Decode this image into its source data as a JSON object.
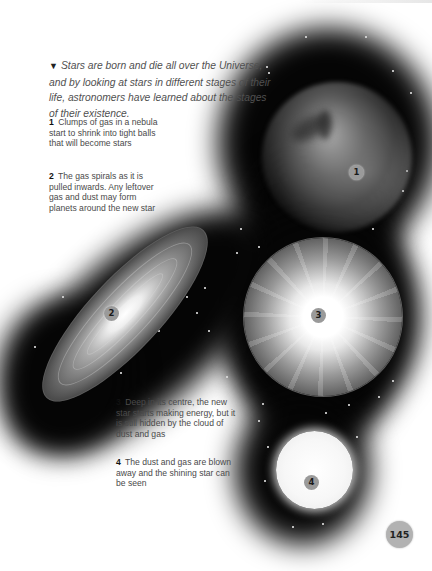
{
  "page": {
    "intro": {
      "marker_icon": "down-triangle",
      "marker_glyph": "▼",
      "text": "Stars are born and die all over the Universe, and by looking at stars in different stages of their life, astronomers have learned about the stages of their existence."
    },
    "captions": [
      {
        "number": "1",
        "text": "Clumps of gas in a nebula start to shrink into tight balls that will become stars"
      },
      {
        "number": "2",
        "text": "The gas spirals as it is pulled inwards. Any leftover gas and dust may form planets around the new star"
      },
      {
        "number": "3",
        "text": "Deep in its centre, the new star starts making energy, but it is still hidden by the cloud of dust and gas"
      },
      {
        "number": "4",
        "text": "The dust and gas are blown away and the shining star can be seen"
      }
    ],
    "illustrations": [
      {
        "label": "1",
        "subject": "nebula"
      },
      {
        "label": "2",
        "subject": "spiral disc"
      },
      {
        "label": "3",
        "subject": "protostar in cloud"
      },
      {
        "label": "4",
        "subject": "shining star"
      }
    ],
    "page_number": "145",
    "colors": {
      "background": "#ffffff",
      "space": "#050505",
      "badge": "#9a9a9a",
      "folio": "#b2b2b2",
      "body_text": "#4a4a4a"
    }
  }
}
